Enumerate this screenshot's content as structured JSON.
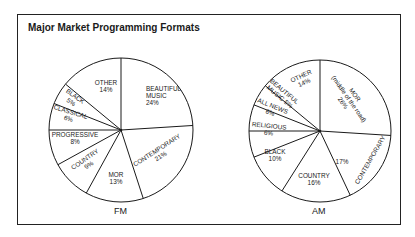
{
  "title": "Major Market Programming Formats",
  "chart_data": [
    {
      "type": "pie",
      "title": "FM",
      "start_angle": "12 o'clock",
      "direction": "clockwise",
      "center": [
        121,
        130
      ],
      "radius": 72,
      "slices": [
        {
          "label": "BEAUTIFUL MUSIC",
          "value": 24,
          "text": [
            "BEAUTIFUL",
            "MUSIC",
            "24%"
          ],
          "lx": 146,
          "ly": 91,
          "rot": 0,
          "anchor": "start"
        },
        {
          "label": "CONTEMPORARY",
          "value": 21,
          "text": [
            "CONTEMPORARY",
            "21%"
          ],
          "lx": 158,
          "ly": 152,
          "rot": -33,
          "anchor": "middle"
        },
        {
          "label": "MOR",
          "value": 13,
          "text": [
            "MOR",
            "13%"
          ],
          "lx": 116,
          "ly": 177,
          "rot": 0,
          "anchor": "middle"
        },
        {
          "label": "COUNTRY",
          "value": 9,
          "text": [
            "COUNTRY",
            "9%"
          ],
          "lx": 86,
          "ly": 161,
          "rot": -35,
          "anchor": "middle"
        },
        {
          "label": "PROGRESSIVE",
          "value": 8,
          "text": [
            "PROGRESSIVE",
            "8%"
          ],
          "lx": 75,
          "ly": 137,
          "rot": 0,
          "anchor": "middle"
        },
        {
          "label": "CLASSICAL",
          "value": 6,
          "text": [
            "CLASSICAL",
            "6%"
          ],
          "lx": 70,
          "ly": 114,
          "rot": 17,
          "anchor": "middle"
        },
        {
          "label": "BLACK",
          "value": 5,
          "text": [
            "BLACK",
            "5%"
          ],
          "lx": 74,
          "ly": 98,
          "rot": 35,
          "anchor": "middle"
        },
        {
          "label": "OTHER",
          "value": 14,
          "text": [
            "OTHER",
            "14%"
          ],
          "lx": 106,
          "ly": 85,
          "rot": 0,
          "anchor": "middle"
        }
      ]
    },
    {
      "type": "pie",
      "title": "AM",
      "start_angle": "12 o'clock",
      "direction": "clockwise",
      "center": [
        320,
        131
      ],
      "radius": 71,
      "slices": [
        {
          "label": "MOR (middle of the road)",
          "value": 26,
          "text": [
            "MOR",
            "(middle of the road)",
            "26%"
          ],
          "lx": 353,
          "ly": 96,
          "rot": 55,
          "anchor": "middle"
        },
        {
          "label": "CONTEMPORARY",
          "value": 17,
          "text": [
            "17%",
            "CONTEMPORARY"
          ],
          "lx": 355,
          "ly": 165,
          "rot": -60,
          "anchor": "middle",
          "special": "am-contemporary"
        },
        {
          "label": "COUNTRY",
          "value": 16,
          "text": [
            "COUNTRY",
            "16%"
          ],
          "lx": 314,
          "ly": 178,
          "rot": 0,
          "anchor": "middle"
        },
        {
          "label": "BLACK",
          "value": 10,
          "text": [
            "BLACK",
            "10%"
          ],
          "lx": 275,
          "ly": 154,
          "rot": 0,
          "anchor": "middle"
        },
        {
          "label": "RELIGIOUS",
          "value": 6,
          "text": [
            "RELIGIOUS",
            "6%"
          ],
          "lx": 269,
          "ly": 128,
          "rot": 6,
          "anchor": "middle"
        },
        {
          "label": "ALL NEWS",
          "value": 6,
          "text": [
            "ALL NEWS",
            "6%"
          ],
          "lx": 272,
          "ly": 108,
          "rot": 22,
          "anchor": "middle"
        },
        {
          "label": "BEAUTIFUL MUSIC",
          "value": 5,
          "text": [
            "BEAUTIFUL",
            "MUSIC 5%"
          ],
          "lx": 283,
          "ly": 93,
          "rot": 40,
          "anchor": "middle"
        },
        {
          "label": "OTHER",
          "value": 14,
          "text": [
            "OTHER",
            "14%"
          ],
          "lx": 302,
          "ly": 78,
          "rot": -25,
          "anchor": "middle"
        }
      ]
    }
  ],
  "captions": {
    "fm": "FM",
    "am": "AM"
  },
  "colors": {
    "line": "#1a1a1a",
    "fill": "#ffffff",
    "background": "#ffffff"
  }
}
